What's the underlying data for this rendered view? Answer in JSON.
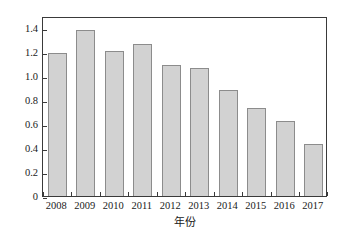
{
  "chart_data": {
    "type": "bar",
    "title": "",
    "subtitle": "",
    "xlabel": "年份",
    "ylabel": "比值",
    "categories": [
      "2008",
      "2009",
      "2010",
      "2011",
      "2012",
      "2013",
      "2014",
      "2015",
      "2016",
      "2017"
    ],
    "values": [
      1.19,
      1.385,
      1.21,
      1.265,
      1.09,
      1.065,
      0.885,
      0.735,
      0.625,
      0.435
    ],
    "series": [
      {
        "name": "比值",
        "values": [
          1.19,
          1.385,
          1.21,
          1.265,
          1.09,
          1.065,
          0.885,
          0.735,
          0.625,
          0.435
        ]
      }
    ],
    "ylim": [
      0,
      1.5
    ],
    "xlim": [
      0,
      10
    ],
    "yticks": [
      0,
      0.2,
      0.4,
      0.6,
      0.8,
      1.0,
      1.2,
      1.4
    ],
    "ytick_labels": [
      "0",
      "0.2",
      "0.4",
      "0.6",
      "0.8",
      "1.0",
      "1.2",
      "1.4"
    ],
    "grid": false,
    "legend": null,
    "legend_position": "none",
    "bar_fill_color": "#d2d2d2",
    "bar_border_color": "#8c8c8c",
    "axis_color": "#3a3a3a",
    "text_color": "#1a1a1a",
    "background_color": "#ffffff",
    "annotations": []
  }
}
